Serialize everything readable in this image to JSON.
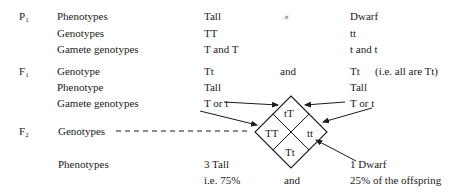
{
  "generations": {
    "p1": {
      "letter": "P",
      "sub": "1"
    },
    "f1": {
      "letter": "F",
      "sub": "1"
    },
    "f2": {
      "letter": "F",
      "sub": "2"
    }
  },
  "p1_rows": [
    {
      "label": "Phenotypes",
      "left": "Tall",
      "middle": "×",
      "right": "Dwarf"
    },
    {
      "label": "Genotypes",
      "left": "TT",
      "right": "tt"
    },
    {
      "label": "Gamete genotypes",
      "left": "T and T",
      "right": "t and t"
    }
  ],
  "f1_rows": [
    {
      "label": "Genotype",
      "left": "Tt",
      "middle": "and",
      "right": "Tt",
      "note": "(i.e. all are Tt)"
    },
    {
      "label": "Phenotype",
      "left": "Tall",
      "right": "Tall"
    },
    {
      "label": "Gamete genotypes",
      "left": "T or t",
      "right": "T or t"
    }
  ],
  "f2": {
    "genotypes_label": "Genotypes",
    "phenotypes_label": "Phenotypes",
    "punnett": {
      "top": "tT",
      "left": "TT",
      "right": "tt",
      "bottom": "Tt"
    },
    "tall_count": "3 Tall",
    "tall_percent": "i.e. 75%",
    "and": "and",
    "dwarf_count": "1 Dwarf",
    "dwarf_percent": "25% of the offspring"
  }
}
